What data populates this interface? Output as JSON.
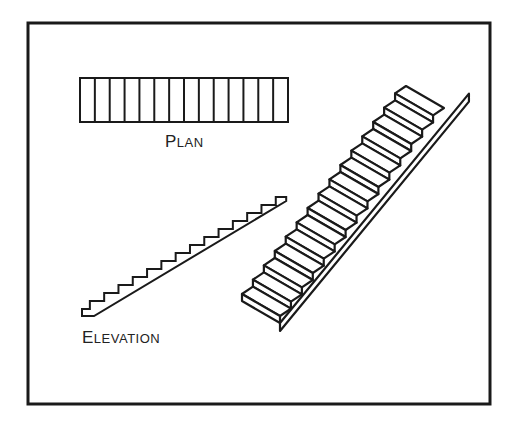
{
  "diagram": {
    "labels": {
      "plan": {
        "first": "P",
        "rest": "LAN"
      },
      "elevation": {
        "first": "E",
        "rest": "LEVATION"
      }
    },
    "plan_treads": 14,
    "elevation_steps": 14,
    "isometric_steps": 15,
    "stroke_color": "#1a1a1a"
  }
}
